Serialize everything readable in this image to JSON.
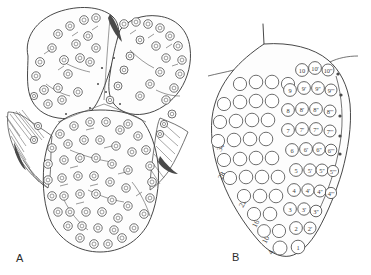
{
  "figure": {
    "panels": [
      {
        "id": "A",
        "label": "A",
        "caption_text": "A",
        "description": "Dorsal lobed body with scattered double-ring pore organs and hatched shading at the margins",
        "pore_count": 96
      },
      {
        "id": "B",
        "label": "B",
        "caption_text": "B",
        "description": "Outline with ordered rows of circular organs; right-hand circles numbered 1 to 10 with prime series",
        "edge_labels": [
          "34",
          "28"
        ],
        "row_numbers": [
          "1",
          "2",
          "3",
          "4",
          "5",
          "6",
          "7",
          "8",
          "9",
          "10"
        ],
        "prime_marks": [
          "",
          "'",
          "''",
          "'''"
        ]
      }
    ],
    "panel_b_numbered_rows": [
      {
        "base": "10",
        "members": [
          "10",
          "10'",
          "10''"
        ]
      },
      {
        "base": "9",
        "members": [
          "9",
          "9'",
          "9''",
          "9'''"
        ]
      },
      {
        "base": "8",
        "members": [
          "8",
          "8'",
          "8''",
          "8'''"
        ]
      },
      {
        "base": "7",
        "members": [
          "7",
          "7'",
          "7''",
          "7'''"
        ]
      },
      {
        "base": "6",
        "members": [
          "6",
          "6'",
          "6''",
          "6'''"
        ]
      },
      {
        "base": "5",
        "members": [
          "5",
          "5'",
          "5''",
          "5'''"
        ]
      },
      {
        "base": "4",
        "members": [
          "4",
          "4'",
          "4''",
          "4'''"
        ]
      },
      {
        "base": "3",
        "members": [
          "3",
          "3'",
          "3''"
        ]
      },
      {
        "base": "2",
        "members": [
          "2",
          "2'"
        ]
      },
      {
        "base": "1",
        "members": [
          "1"
        ]
      }
    ],
    "colors": {
      "background": "#ffffff",
      "ink": "#333333",
      "ink_light": "#5a5a5a",
      "label": "#2b2b2b"
    }
  }
}
